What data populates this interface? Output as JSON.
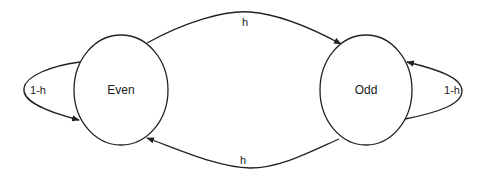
{
  "diagram": {
    "type": "state-transition",
    "states": [
      {
        "id": "even",
        "label": "Even"
      },
      {
        "id": "odd",
        "label": "Odd"
      }
    ],
    "transitions": [
      {
        "from": "even",
        "to": "odd",
        "label": "h"
      },
      {
        "from": "odd",
        "to": "even",
        "label": "h"
      },
      {
        "from": "even",
        "to": "even",
        "label": "1-h"
      },
      {
        "from": "odd",
        "to": "odd",
        "label": "1-h"
      }
    ],
    "colors": {
      "stroke": "#222222",
      "background": "#ffffff"
    }
  }
}
